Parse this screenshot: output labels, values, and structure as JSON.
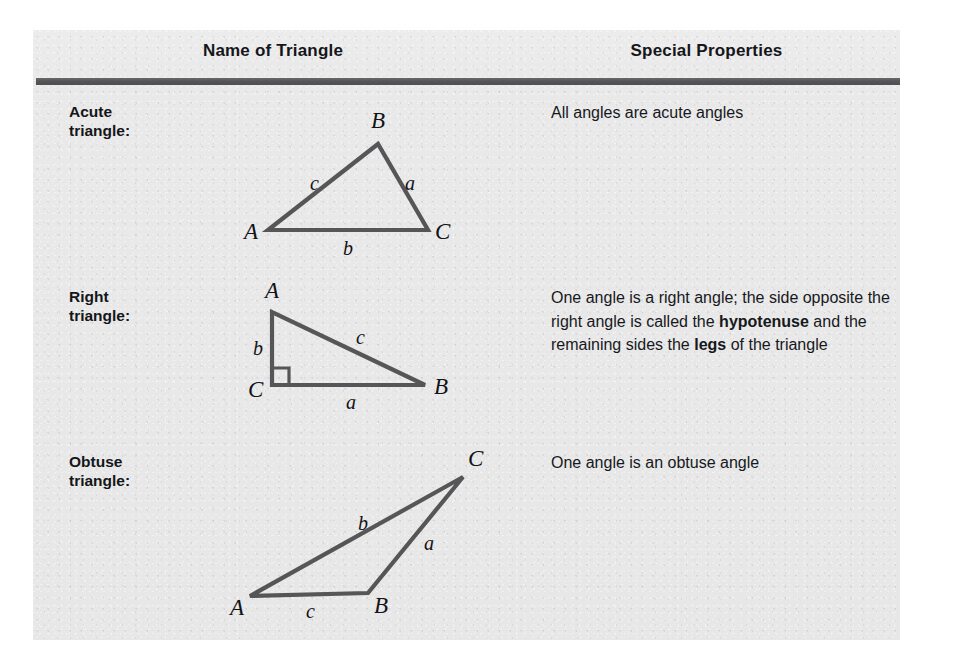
{
  "panel": {
    "bg_color": "#e8e8e8",
    "rule_color": "#555558",
    "stroke_color": "#565659"
  },
  "header": {
    "col_name": "Name of Triangle",
    "col_properties": "Special Properties"
  },
  "rows": [
    {
      "label_line1": "Acute",
      "label_line2": "triangle:",
      "property_text": "All angles are acute angles",
      "figure": {
        "type": "acute-triangle",
        "vertices": [
          {
            "name": "A",
            "x": 30,
            "y": 130
          },
          {
            "name": "B",
            "x": 140,
            "y": 44
          },
          {
            "name": "C",
            "x": 190,
            "y": 130
          }
        ],
        "side_labels": [
          {
            "name": "c",
            "x": 72,
            "y": 90
          },
          {
            "name": "a",
            "x": 167,
            "y": 90
          },
          {
            "name": "b",
            "x": 105,
            "y": 155
          }
        ],
        "vertex_labels": [
          {
            "name": "A",
            "x": 6,
            "y": 139
          },
          {
            "name": "B",
            "x": 133,
            "y": 28
          },
          {
            "name": "C",
            "x": 197,
            "y": 139
          }
        ]
      }
    },
    {
      "label_line1": "Right",
      "label_line2": "triangle:",
      "property_text_runs": [
        {
          "text": "One angle is a right angle; the side opposite the right angle is called the ",
          "bold": false
        },
        {
          "text": "hypotenuse",
          "bold": true
        },
        {
          "text": " and the remaining sides the ",
          "bold": false
        },
        {
          "text": "legs",
          "bold": true
        },
        {
          "text": " of the triangle",
          "bold": false
        }
      ],
      "figure": {
        "type": "right-triangle",
        "right_angle_at": "C",
        "vertices": [
          {
            "name": "A",
            "x": 36,
            "y": 32
          },
          {
            "name": "C",
            "x": 36,
            "y": 105
          },
          {
            "name": "B",
            "x": 189,
            "y": 105
          }
        ],
        "side_labels": [
          {
            "name": "b",
            "x": 17,
            "y": 75
          },
          {
            "name": "c",
            "x": 120,
            "y": 64
          },
          {
            "name": "a",
            "x": 110,
            "y": 129
          }
        ],
        "vertex_labels": [
          {
            "name": "A",
            "x": 29,
            "y": 18
          },
          {
            "name": "C",
            "x": 12,
            "y": 117
          },
          {
            "name": "B",
            "x": 198,
            "y": 114
          }
        ]
      }
    },
    {
      "label_line1": "Obtuse",
      "label_line2": "triangle:",
      "property_text": "One angle is an obtuse angle",
      "figure": {
        "type": "obtuse-triangle",
        "vertices": [
          {
            "name": "A",
            "x": 22,
            "y": 146
          },
          {
            "name": "B",
            "x": 140,
            "y": 143
          },
          {
            "name": "C",
            "x": 235,
            "y": 27
          }
        ],
        "side_labels": [
          {
            "name": "b",
            "x": 130,
            "y": 80
          },
          {
            "name": "a",
            "x": 196,
            "y": 100
          },
          {
            "name": "c",
            "x": 78,
            "y": 168
          }
        ],
        "vertex_labels": [
          {
            "name": "A",
            "x": 2,
            "y": 165
          },
          {
            "name": "B",
            "x": 146,
            "y": 163
          },
          {
            "name": "C",
            "x": 240,
            "y": 16
          }
        ]
      }
    }
  ]
}
